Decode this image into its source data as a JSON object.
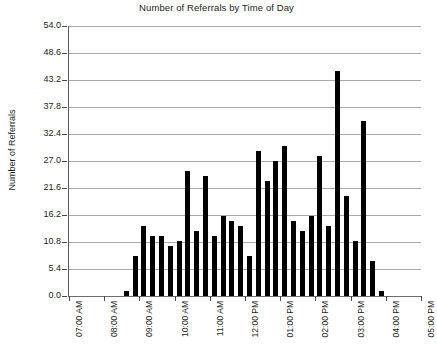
{
  "chart_data": {
    "type": "bar",
    "title": "Number of Referrals by Time of Day",
    "xlabel": "",
    "ylabel": "Number of Referrals",
    "ylim": [
      0.0,
      54.0
    ],
    "ytick_labels": [
      "0.0",
      "5.4",
      "10.8",
      "16.2",
      "21.6",
      "27.0",
      "32.4",
      "37.8",
      "43.2",
      "48.6",
      "54.0"
    ],
    "ytick_values": [
      0.0,
      5.4,
      10.8,
      16.2,
      21.6,
      27.0,
      32.4,
      37.8,
      43.2,
      48.6,
      54.0
    ],
    "xtick_labels": [
      "07:00 AM",
      "08:00 AM",
      "09:00 AM",
      "10:00 AM",
      "11:00 AM",
      "12:00 PM",
      "01:00 PM",
      "02:00 PM",
      "03:00 PM",
      "04:00 PM",
      "05:00 PM"
    ],
    "grid": true,
    "legend": "none",
    "bin_minutes": 15,
    "bar_color": "#000000",
    "grid_color": "#a9a9a9",
    "axis_color": "#5a5a5a",
    "categories": [
      "07:00 AM",
      "07:15 AM",
      "07:30 AM",
      "07:45 AM",
      "08:00 AM",
      "08:15 AM",
      "08:30 AM",
      "08:45 AM",
      "09:00 AM",
      "09:15 AM",
      "09:30 AM",
      "09:45 AM",
      "10:00 AM",
      "10:15 AM",
      "10:30 AM",
      "10:45 AM",
      "11:00 AM",
      "11:15 AM",
      "11:30 AM",
      "11:45 AM",
      "12:00 PM",
      "12:15 PM",
      "12:30 PM",
      "12:45 PM",
      "01:00 PM",
      "01:15 PM",
      "01:30 PM",
      "01:45 PM",
      "02:00 PM",
      "02:15 PM",
      "02:30 PM",
      "02:45 PM",
      "03:00 PM",
      "03:15 PM",
      "03:30 PM",
      "03:45 PM",
      "04:00 PM",
      "04:15 PM",
      "04:30 PM",
      "04:45 PM",
      "05:00 PM"
    ],
    "values": [
      0,
      0,
      0,
      0,
      0,
      0,
      1,
      8,
      14,
      12,
      12,
      10,
      11,
      25,
      13,
      24,
      12,
      16,
      15,
      14,
      8,
      29,
      23,
      27,
      30,
      15,
      13,
      16,
      28,
      14,
      45,
      20,
      11,
      35,
      7,
      1,
      0,
      0,
      0,
      0,
      0
    ]
  }
}
